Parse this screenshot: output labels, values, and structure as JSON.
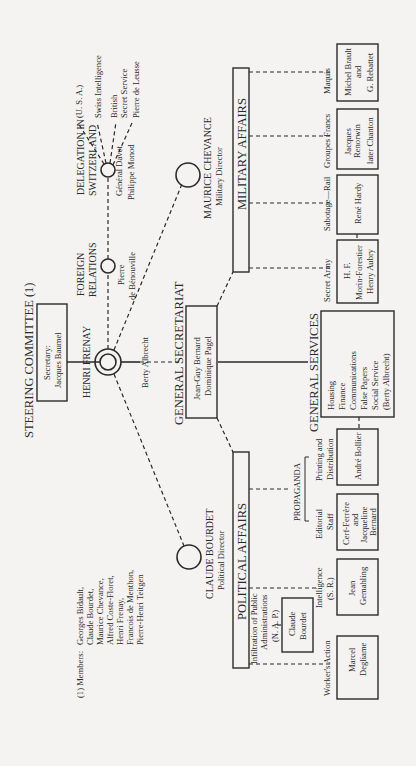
{
  "title": "STEERING COMMITTEE (1)",
  "secretary": {
    "line1": "Secretary:",
    "line2": "Jacques Baumel"
  },
  "leader": "HENRI FRENAY",
  "foreign_relations": {
    "line1": "FOREIGN",
    "line2": "RELATIONS",
    "person1": "Pierre",
    "person2": "de Bénouville"
  },
  "delegation": {
    "line1": "DELEGATION IN",
    "line2": "SWITZERLAND",
    "person1": "Général Davet",
    "person2": "Philippe Monod",
    "links": [
      "(U. S. A.)",
      "Swiss Intelligence",
      "British",
      "Secret Service",
      "Pierre de Leusse"
    ]
  },
  "military_director": {
    "name": "MAURICE CHEVANCE",
    "role": "Military Director"
  },
  "political_director": {
    "name": "CLAUDE BOURDET",
    "role": "Political Director"
  },
  "berty": "Berty Albrecht",
  "general_secretariat": {
    "title": "GENERAL SECRETARIAT",
    "line1": "Jean-Guy Bernard",
    "line2": "Dominique Pagel"
  },
  "military_affairs": {
    "title": "MILITARY AFFAIRS",
    "units": [
      {
        "label": "Secret Army",
        "people": [
          "H. F.",
          "Morin-Forestier",
          "Henry Aubry"
        ]
      },
      {
        "label": "Sabotage—Rail",
        "people": [
          "René Hardy"
        ]
      },
      {
        "label": "Groupes Francs",
        "people": [
          "Jacques",
          "Renorwin",
          "later Chanton"
        ]
      },
      {
        "label": "Maquis",
        "people": [
          "Michel Brault",
          "and",
          "G. Rebattet"
        ]
      }
    ]
  },
  "general_services": {
    "title": "GENERAL SERVICES",
    "items": [
      "Housing",
      "Finance",
      "Communications",
      "False Papers",
      "Social Service",
      "(Berty Albrecht)"
    ]
  },
  "political_affairs": {
    "title": "POLITICAL AFFAIRS",
    "propaganda": {
      "title": "PROPAGANDA",
      "printing": {
        "label1": "Printing and",
        "label2": "Distribution",
        "person": "André Bollier"
      },
      "editorial": {
        "label1": "Editorial",
        "label2": "Staff",
        "people": [
          "Cerf-Ferrère",
          "and",
          "Jacqueline",
          "Bernard"
        ]
      }
    },
    "intelligence": {
      "label1": "Intelligence",
      "label2": "(S. R.)",
      "people": [
        "Jean",
        "Gemahling"
      ]
    },
    "nap": {
      "label1": "Infiltration of Public",
      "label2": "Administrations",
      "label3": "(N. A. P.)",
      "people": [
        "Claude",
        "Bourdet"
      ]
    },
    "workers": {
      "label": "Worker's Action",
      "people": [
        "Marcel",
        "Degliame"
      ]
    }
  },
  "footnote": {
    "prefix": "(1) Members:",
    "names": [
      "Georges Bidault,",
      "Claude Bourdet,",
      "Maurice Chevance,",
      "Alfred Coste-Floret,",
      "Henri Frenay,",
      "Francois de Menthon,",
      "Pierre-Henri Teitgen"
    ]
  }
}
